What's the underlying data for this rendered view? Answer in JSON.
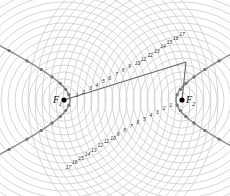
{
  "diagram": {
    "foci": [
      {
        "label": "F",
        "sub": "1",
        "x": 64,
        "y": 100
      },
      {
        "label": "F",
        "sub": "2",
        "x": 182,
        "y": 100
      }
    ],
    "circle_spacing": 7,
    "circle_count": 22,
    "colors": {
      "circles": "#cccccc",
      "curve": "#888888",
      "lines": "#666666",
      "points": "#777777",
      "focus": "#000000"
    },
    "upper_labels": [
      "1",
      "2",
      "3",
      "4",
      "5",
      "6",
      "7",
      "8",
      "9",
      "10",
      "11",
      "12",
      "13",
      "14",
      "15",
      "16",
      "17"
    ],
    "lower_labels": [
      "1",
      "2",
      "3",
      "4",
      "5",
      "6",
      "7",
      "8",
      "9",
      "10",
      "11",
      "12",
      "13",
      "14",
      "15",
      "16",
      "17"
    ],
    "point_P": {
      "x": 186,
      "y": 62
    }
  }
}
